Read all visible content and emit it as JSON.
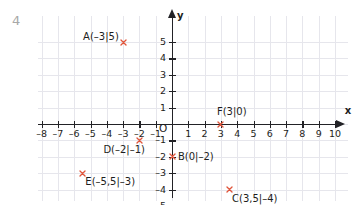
{
  "exercise": {
    "number": "4"
  },
  "chart_data": {
    "type": "scatter",
    "title": "",
    "xlabel": "x",
    "ylabel": "y",
    "grid": true,
    "legend": "none",
    "origin_label": "O",
    "xlim": [
      -8.5,
      10.5
    ],
    "ylim": [
      -5.5,
      5.8
    ],
    "x_ticks": [
      -8,
      -7,
      -6,
      -5,
      -4,
      -3,
      -2,
      -1,
      1,
      2,
      3,
      4,
      5,
      6,
      7,
      8,
      9,
      10
    ],
    "x_tick_labels": [
      "–8",
      "–7",
      "–6",
      "–5",
      "–4",
      "–3",
      "–2",
      "–1",
      "1",
      "2",
      "3",
      "4",
      "5",
      "6",
      "7",
      "8",
      "9",
      "10"
    ],
    "y_ticks": [
      5,
      4,
      3,
      2,
      1,
      -1,
      -2,
      -3,
      -4,
      -5
    ],
    "y_tick_labels": [
      "5",
      "4",
      "3",
      "2",
      "1",
      "–1",
      "–2",
      "–3",
      "–4",
      "–5"
    ],
    "point_color": "#e0553b",
    "axis_color": "#222226",
    "grid_color": "#e6e6ec",
    "points": [
      {
        "name": "A",
        "label": "A(–3|5)",
        "x": -3,
        "y": 5,
        "label_pos": "left"
      },
      {
        "name": "B",
        "label": "B(0|–2)",
        "x": 0,
        "y": -2,
        "label_pos": "right"
      },
      {
        "name": "C",
        "label": "C(3,5|–4)",
        "x": 3.5,
        "y": -4,
        "label_pos": "below-right"
      },
      {
        "name": "D",
        "label": "D(–2|–1)",
        "x": -2,
        "y": -1,
        "label_pos": "below-left"
      },
      {
        "name": "E",
        "label": "E(–5,5|–3)",
        "x": -5.5,
        "y": -3,
        "label_pos": "below-right"
      },
      {
        "name": "F",
        "label": "F(3|0)",
        "x": 3,
        "y": 0,
        "label_pos": "above-right"
      }
    ]
  }
}
